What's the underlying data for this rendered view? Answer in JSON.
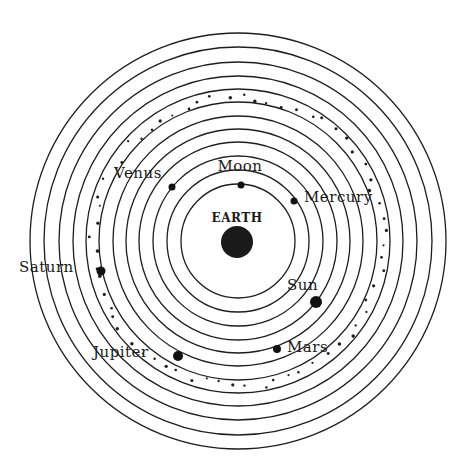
{
  "diagram": {
    "type": "geocentric-model",
    "center": {
      "x": 238,
      "y": 241
    },
    "ring_color": "#1e1e1e",
    "ring_radii": [
      57,
      71,
      85,
      99,
      112,
      125,
      139,
      152,
      165,
      179,
      194,
      208
    ],
    "star_band_radius": 145,
    "earth": {
      "label": "EARTH",
      "x": 237,
      "y": 242,
      "r": 16,
      "label_x": 237,
      "label_y": 222,
      "color": "#1a1a1a"
    },
    "bodies": [
      {
        "name": "Moon",
        "label": "Moon",
        "x": 241,
        "y": 185,
        "r": 3.5,
        "label_x": 240,
        "label_y": 171,
        "anchor": "middle"
      },
      {
        "name": "Venus",
        "label": "Venus",
        "x": 172,
        "y": 187,
        "r": 3.5,
        "label_x": 114,
        "label_y": 178,
        "anchor": "start"
      },
      {
        "name": "Mercury",
        "label": "Mercury",
        "x": 294,
        "y": 201,
        "r": 3.5,
        "label_x": 304,
        "label_y": 202,
        "anchor": "start"
      },
      {
        "name": "Saturn",
        "label": "Saturn",
        "x": 101,
        "y": 271,
        "r": 4.5,
        "label_x": 19,
        "label_y": 272,
        "anchor": "start"
      },
      {
        "name": "Sun",
        "label": "Sun",
        "x": 316,
        "y": 302,
        "r": 6,
        "label_x": 287,
        "label_y": 290,
        "anchor": "start"
      },
      {
        "name": "Jupiter",
        "label": "Jupiter",
        "x": 178,
        "y": 356,
        "r": 5,
        "label_x": 93,
        "label_y": 357,
        "anchor": "start"
      },
      {
        "name": "Mars",
        "label": "Mars",
        "x": 277,
        "y": 349,
        "r": 4,
        "label_x": 287,
        "label_y": 352,
        "anchor": "start"
      }
    ]
  }
}
